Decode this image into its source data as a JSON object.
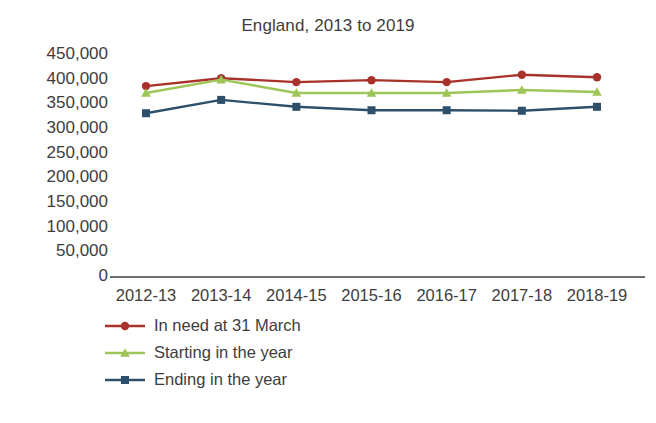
{
  "chart_data": {
    "type": "line",
    "title": "England, 2013 to 2019",
    "xlabel": "",
    "ylabel": "",
    "categories": [
      "2012-13",
      "2013-14",
      "2014-15",
      "2015-16",
      "2016-17",
      "2017-18",
      "2018-19"
    ],
    "ylim": [
      0,
      450000
    ],
    "ytick_step": 50000,
    "ytick_labels": [
      "450,000",
      "400,000",
      "350,000",
      "300,000",
      "250,000",
      "200,000",
      "150,000",
      "100,000",
      "50,000",
      "0"
    ],
    "ytick_values": [
      450000,
      400000,
      350000,
      300000,
      250000,
      200000,
      150000,
      100000,
      50000,
      0
    ],
    "grid": false,
    "legend_position": "below",
    "series": [
      {
        "name": "In need at 31 March",
        "color": "#a8312a",
        "marker": "circle",
        "values": [
          387000,
          403000,
          395000,
          399000,
          395000,
          410000,
          405000
        ]
      },
      {
        "name": "Starting in the year",
        "color": "#9dc557",
        "marker": "triangle",
        "values": [
          373000,
          400000,
          373000,
          373000,
          373000,
          379000,
          375000
        ]
      },
      {
        "name": "Ending in the year",
        "color": "#2c4f6b",
        "marker": "square",
        "values": [
          332000,
          359000,
          345000,
          338000,
          338000,
          337000,
          345000
        ]
      }
    ]
  }
}
